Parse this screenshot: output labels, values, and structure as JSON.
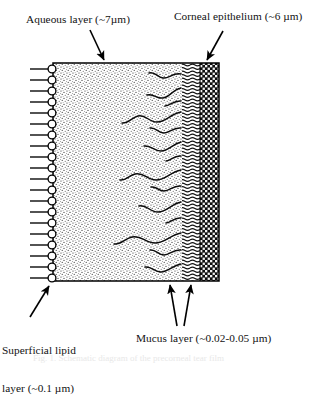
{
  "figure": {
    "caption_partial": "Fig. 1. Schematic diagram of the precorneal tear film",
    "labels": {
      "aqueous": "Aqueous layer (~7µm)",
      "corneal": "Corneal epithelium (~6 µm)",
      "lipid_line1": "Superficial lipid",
      "lipid_line2": "layer (~0.1 µm)",
      "mucus": "Mucus layer (~0.02-0.05 µm)"
    },
    "layers": [
      {
        "name": "superficial-lipid-layer",
        "label": "Superficial lipid layer (~0.1 µm)",
        "thickness": "~0.1 µm",
        "render": "phospholipid heads with tails",
        "molecule_count": 19,
        "color": "#000000"
      },
      {
        "name": "aqueous-layer",
        "label": "Aqueous layer (~7µm)",
        "thickness": "~7µm",
        "render": "fine stipple",
        "color": "#000000"
      },
      {
        "name": "mucus-layer",
        "label": "Mucus layer (~0.02-0.05 µm)",
        "thickness": "~0.02-0.05 µm",
        "render": "wavy mucin strands",
        "strand_count": 11,
        "color": "#000000"
      },
      {
        "name": "corneal-epithelium",
        "label": "Corneal epithelium (~6 µm)",
        "thickness": "~6 µm",
        "render": "dense checkered cell packing",
        "color": "#000000"
      }
    ],
    "box": {
      "left": 53,
      "top": 63,
      "right": 219,
      "bottom": 281,
      "stroke": "#000000"
    },
    "colors": {
      "ink": "#000000",
      "paper": "#ffffff",
      "stipple": "#2b2b2b",
      "epithelium": "#101010"
    },
    "pointers": [
      {
        "name": "aqueous-arrow",
        "from": [
          90,
          30
        ],
        "to": [
          104,
          62
        ]
      },
      {
        "name": "corneal-arrow",
        "from": [
          223,
          31
        ],
        "to": [
          207,
          62
        ]
      },
      {
        "name": "lipid-arrow",
        "from": [
          30,
          318
        ],
        "to": [
          50,
          284
        ]
      },
      {
        "name": "mucus-arrow-1",
        "from": [
          177,
          326
        ],
        "to": [
          170,
          283
        ]
      },
      {
        "name": "mucus-arrow-2",
        "from": [
          184,
          326
        ],
        "to": [
          191,
          283
        ]
      }
    ]
  }
}
